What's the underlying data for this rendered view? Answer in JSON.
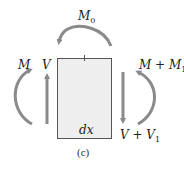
{
  "figure": {
    "caption": "(c)",
    "element_label": "dx",
    "colors": {
      "element_fill": "#eeeeee",
      "element_stroke": "#555555",
      "arrow": "#8a8a8a",
      "text": "#222222"
    }
  },
  "labels": {
    "applied_moment": {
      "main": "M",
      "sub": "0"
    },
    "left_moment": {
      "main": "M"
    },
    "left_shear": {
      "main": "V"
    },
    "right_moment": {
      "main": "M + M",
      "sub": "1"
    },
    "right_shear": {
      "main": "V + V",
      "sub": "1"
    }
  }
}
